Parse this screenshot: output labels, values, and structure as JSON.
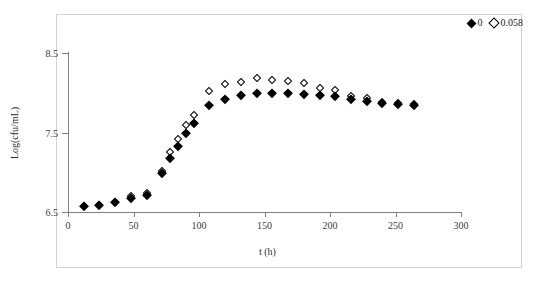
{
  "chart": {
    "xlabel": "t (h)",
    "ylabel": "Log(cfu/mL)",
    "xticks": [
      "0",
      "50",
      "100",
      "150",
      "200",
      "250",
      "300"
    ],
    "yticks": [
      "6.5",
      "7.5",
      "8.5"
    ],
    "legend": [
      {
        "label": "0",
        "marker": "filled-diamond-icon"
      },
      {
        "label": "0.058",
        "marker": "open-diamond-icon"
      }
    ]
  },
  "chart_data": {
    "type": "scatter",
    "title": "",
    "xlabel": "t (h)",
    "ylabel": "Log(cfu/mL)",
    "xlim": [
      0,
      300
    ],
    "ylim": [
      6.5,
      8.5
    ],
    "xticks": [
      0,
      50,
      100,
      150,
      200,
      250,
      300
    ],
    "yticks": [
      6.5,
      7.5,
      8.5
    ],
    "grid": false,
    "legend_position": "top-right",
    "series": [
      {
        "name": "0",
        "marker": "filled diamond",
        "color": "#000000",
        "x": [
          12,
          24,
          36,
          48,
          60,
          72,
          78,
          84,
          90,
          96,
          108,
          120,
          132,
          144,
          156,
          168,
          180,
          192,
          204,
          216,
          228,
          240,
          252,
          264
        ],
        "y": [
          6.57,
          6.59,
          6.62,
          6.68,
          6.72,
          6.99,
          7.18,
          7.33,
          7.5,
          7.62,
          7.85,
          7.92,
          7.97,
          8.0,
          8.0,
          8.0,
          7.99,
          7.97,
          7.96,
          7.92,
          7.9,
          7.87,
          7.86,
          7.85
        ]
      },
      {
        "name": "0.058",
        "marker": "open diamond",
        "color": "#000000",
        "x": [
          12,
          24,
          36,
          48,
          60,
          72,
          78,
          84,
          90,
          96,
          108,
          120,
          132,
          144,
          156,
          168,
          180,
          192,
          204,
          216,
          228,
          240,
          252,
          264
        ],
        "y": [
          6.57,
          6.59,
          6.63,
          6.7,
          6.74,
          7.01,
          7.26,
          7.42,
          7.6,
          7.72,
          8.02,
          8.11,
          8.14,
          8.18,
          8.16,
          8.15,
          8.12,
          8.06,
          8.03,
          7.96,
          7.93,
          7.88,
          7.87,
          7.86
        ]
      }
    ]
  }
}
